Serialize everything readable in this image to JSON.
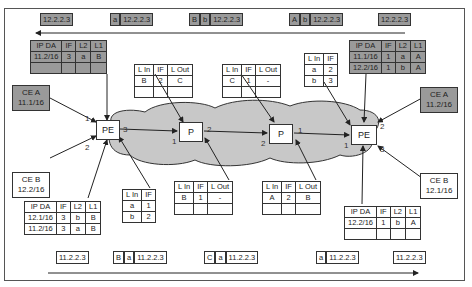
{
  "diagram": {
    "top_packets": [
      {
        "labels": [
          "12.2.2.3"
        ],
        "x": 40,
        "y": 13
      },
      {
        "labels": [
          "a",
          "12.2.2.3"
        ],
        "x": 110,
        "y": 13
      },
      {
        "labels": [
          "B",
          "b",
          "12.2.2.3"
        ],
        "x": 189,
        "y": 13
      },
      {
        "labels": [
          "A",
          "b",
          "12.2.2.3"
        ],
        "x": 289,
        "y": 13
      },
      {
        "labels": [
          "12.2.2.3"
        ],
        "x": 378,
        "y": 13
      }
    ],
    "bottom_packets": [
      {
        "labels": [
          "11.2.2.3"
        ],
        "x": 56,
        "y": 251
      },
      {
        "labels": [
          "B",
          "a",
          "11.2.2.3"
        ],
        "x": 113,
        "y": 251
      },
      {
        "labels": [
          "C",
          "a",
          "11.2.2.3"
        ],
        "x": 204,
        "y": 251
      },
      {
        "labels": [
          "a",
          "11.2.2.3"
        ],
        "x": 316,
        "y": 251
      },
      {
        "labels": [
          "11.2.2.3"
        ],
        "x": 393,
        "y": 251
      }
    ],
    "nodes": {
      "pe_left": "PE",
      "p_left": "P",
      "p_right": "P",
      "pe_right": "PE"
    },
    "ce": {
      "ce_a_left": {
        "name": "CE A",
        "prefix": "11.1/16"
      },
      "ce_b_left": {
        "name": "CE B",
        "prefix": "12.2/16"
      },
      "ce_a_right": {
        "name": "CE A",
        "prefix": "11.2/16"
      },
      "ce_b_right": {
        "name": "CE B",
        "prefix": "12.1/16"
      }
    },
    "ports": {
      "pe_left_1": "1",
      "pe_left_2": "2",
      "pe_left_3": "3",
      "p_left_1": "1",
      "p_left_2": "2",
      "p_right_2": "2",
      "p_right_1": "1",
      "pe_right_1": "1",
      "pe_right_2": "2",
      "pe_right_3": "3"
    },
    "tables": {
      "pe_left_top": {
        "headers": [
          "IP DA",
          "IF",
          "L2",
          "L1"
        ],
        "rows": [
          [
            "11.2/16",
            "3",
            "a",
            "B"
          ],
          [
            "",
            "",
            "",
            ""
          ]
        ]
      },
      "pe_left_bottom": {
        "headers": [
          "IP DA",
          "IF",
          "L2",
          "L1"
        ],
        "rows": [
          [
            "12.1/16",
            "3",
            "b",
            "B"
          ],
          [
            "11.2/16",
            "3",
            "a",
            "B"
          ]
        ]
      },
      "pe_left_lfib": {
        "headers": [
          "L In",
          "IF"
        ],
        "rows": [
          [
            "a",
            "1"
          ],
          [
            "b",
            "2"
          ]
        ]
      },
      "p_left_top": {
        "headers": [
          "L In",
          "IF",
          "L Out"
        ],
        "rows": [
          [
            "B",
            "2",
            "C"
          ],
          [
            "",
            "",
            ""
          ]
        ]
      },
      "p_left_bottom": {
        "headers": [
          "L In",
          "IF",
          "L Out"
        ],
        "rows": [
          [
            "B",
            "1",
            "-"
          ],
          [
            "",
            "",
            ""
          ]
        ]
      },
      "p_right_top": {
        "headers": [
          "L In",
          "IF",
          "L Out"
        ],
        "rows": [
          [
            "C",
            "1",
            "-"
          ],
          [
            "",
            "",
            ""
          ]
        ]
      },
      "p_right_bottom": {
        "headers": [
          "L In",
          "IF",
          "L Out"
        ],
        "rows": [
          [
            "A",
            "2",
            "B"
          ],
          [
            "",
            "",
            ""
          ]
        ]
      },
      "pe_right_lfib": {
        "headers": [
          "L In",
          "IF"
        ],
        "rows": [
          [
            "a",
            "2"
          ],
          [
            "b",
            "3"
          ]
        ]
      },
      "pe_right_top": {
        "headers": [
          "IP DA",
          "IF",
          "L2",
          "L1"
        ],
        "rows": [
          [
            "11.1/16",
            "1",
            "a",
            "A"
          ],
          [
            "12.2/16",
            "1",
            "b",
            "A"
          ]
        ]
      },
      "pe_right_bottom": {
        "headers": [
          "IP DA",
          "IF",
          "L2",
          "L1"
        ],
        "rows": [
          [
            "12.2/16",
            "1",
            "b",
            "A"
          ],
          [
            "",
            "",
            "",
            ""
          ]
        ]
      }
    },
    "colors": {
      "shaded": "#9a9a9a",
      "cloud": "#c8c8c8",
      "line": "#222222"
    }
  }
}
